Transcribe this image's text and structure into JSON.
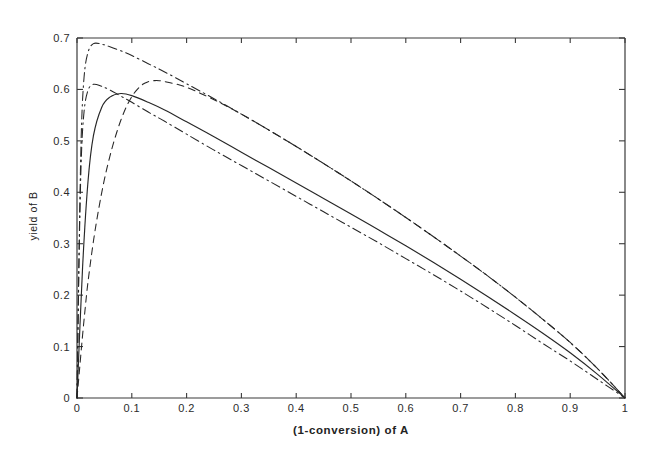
{
  "figure": {
    "background_color": "#ffffff",
    "ink_color": "#262626",
    "axis_color": "#3a3a3a"
  },
  "axes": {
    "x": {
      "label": "(1-conversion) of A",
      "ticks": [
        "0",
        "0.1",
        "0.2",
        "0.3",
        "0.4",
        "0.5",
        "0.6",
        "0.7",
        "0.8",
        "0.9",
        "1"
      ],
      "tick_values": [
        0,
        0.1,
        0.2,
        0.3,
        0.4,
        0.5,
        0.6,
        0.7,
        0.8,
        0.9,
        1
      ],
      "min": 0,
      "max": 1
    },
    "y": {
      "label": "yield of B",
      "ticks": [
        "0",
        "0.1",
        "0.2",
        "0.3",
        "0.4",
        "0.5",
        "0.6",
        "0.7"
      ],
      "tick_values": [
        0,
        0.1,
        0.2,
        0.3,
        0.4,
        0.5,
        0.6,
        0.7
      ],
      "min": 0,
      "max": 0.7
    }
  },
  "chart_data": {
    "type": "line",
    "title": "",
    "xlabel": "(1-conversion) of A",
    "ylabel": "yield of B",
    "xlim": [
      0,
      1
    ],
    "ylim": [
      0,
      0.7
    ],
    "grid": false,
    "legend": "none",
    "series": [
      {
        "name": "curve-dashdot-upper",
        "style": "dash-dot",
        "peak": {
          "x": 0.03,
          "y": 0.69
        },
        "x": [
          0.0,
          0.004,
          0.008,
          0.013,
          0.02,
          0.03,
          0.045,
          0.06,
          0.08,
          0.1,
          0.13,
          0.16,
          0.2,
          0.25,
          0.3,
          0.35,
          0.4,
          0.45,
          0.5,
          0.55,
          0.6,
          0.65,
          0.7,
          0.75,
          0.8,
          0.85,
          0.9,
          0.95,
          1.0
        ],
        "y": [
          0.0,
          0.3,
          0.52,
          0.625,
          0.672,
          0.689,
          0.688,
          0.683,
          0.675,
          0.666,
          0.65,
          0.634,
          0.611,
          0.582,
          0.552,
          0.521,
          0.489,
          0.456,
          0.422,
          0.387,
          0.351,
          0.314,
          0.276,
          0.237,
          0.196,
          0.153,
          0.108,
          0.057,
          0.0
        ]
      },
      {
        "name": "curve-dashed",
        "style": "dashed",
        "peak": {
          "x": 0.15,
          "y": 0.617
        },
        "x": [
          0.0,
          0.005,
          0.01,
          0.015,
          0.02,
          0.03,
          0.04,
          0.05,
          0.06,
          0.07,
          0.08,
          0.09,
          0.1,
          0.11,
          0.12,
          0.13,
          0.14,
          0.15,
          0.17,
          0.2,
          0.25,
          0.3,
          0.35,
          0.4,
          0.45,
          0.5,
          0.55,
          0.6,
          0.65,
          0.7,
          0.75,
          0.8,
          0.85,
          0.9,
          0.95,
          1.0
        ],
        "y": [
          0.0,
          0.06,
          0.12,
          0.175,
          0.225,
          0.305,
          0.37,
          0.425,
          0.47,
          0.508,
          0.54,
          0.566,
          0.586,
          0.6,
          0.61,
          0.615,
          0.617,
          0.617,
          0.613,
          0.604,
          0.58,
          0.552,
          0.521,
          0.489,
          0.456,
          0.422,
          0.387,
          0.351,
          0.314,
          0.276,
          0.237,
          0.196,
          0.153,
          0.108,
          0.057,
          0.0
        ]
      },
      {
        "name": "curve-solid",
        "style": "solid",
        "peak": {
          "x": 0.08,
          "y": 0.592
        },
        "x": [
          0.0,
          0.01,
          0.02,
          0.03,
          0.045,
          0.06,
          0.08,
          0.1,
          0.13,
          0.16,
          0.2,
          0.25,
          0.3,
          0.35,
          0.4,
          0.45,
          0.5,
          0.55,
          0.6,
          0.65,
          0.7,
          0.75,
          0.8,
          0.85,
          0.9,
          0.95,
          1.0
        ],
        "y": [
          0.0,
          0.25,
          0.42,
          0.51,
          0.565,
          0.585,
          0.592,
          0.588,
          0.575,
          0.56,
          0.537,
          0.508,
          0.478,
          0.448,
          0.418,
          0.388,
          0.358,
          0.327,
          0.296,
          0.264,
          0.231,
          0.197,
          0.162,
          0.126,
          0.088,
          0.046,
          0.0
        ]
      },
      {
        "name": "curve-dashdot-lower",
        "style": "dash-dot",
        "peak": {
          "x": 0.02,
          "y": 0.61
        },
        "x": [
          0.0,
          0.004,
          0.008,
          0.013,
          0.02,
          0.03,
          0.045,
          0.06,
          0.08,
          0.1,
          0.13,
          0.16,
          0.2,
          0.25,
          0.3,
          0.35,
          0.4,
          0.45,
          0.5,
          0.55,
          0.6,
          0.65,
          0.7,
          0.75,
          0.8,
          0.85,
          0.9,
          0.95,
          1.0
        ],
        "y": [
          0.0,
          0.285,
          0.47,
          0.558,
          0.598,
          0.61,
          0.606,
          0.599,
          0.587,
          0.575,
          0.556,
          0.538,
          0.513,
          0.482,
          0.452,
          0.422,
          0.392,
          0.362,
          0.332,
          0.302,
          0.271,
          0.24,
          0.208,
          0.175,
          0.141,
          0.106,
          0.072,
          0.036,
          0.0
        ]
      }
    ]
  }
}
